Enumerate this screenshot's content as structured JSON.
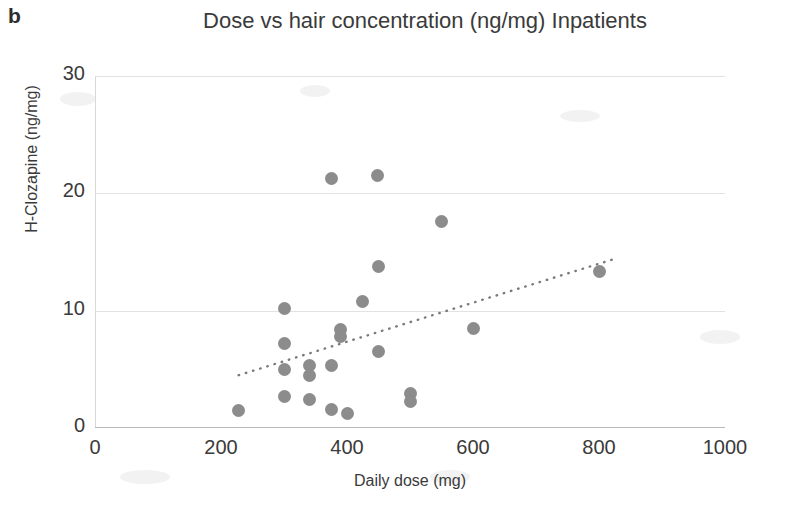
{
  "panel": {
    "label": "b"
  },
  "chart_data": {
    "type": "scatter",
    "title": "Dose vs hair concentration (ng/mg) Inpatients",
    "xlabel": "Daily dose (mg)",
    "ylabel": "H-Clozapine (ng/mg)",
    "xlim": [
      0,
      1000
    ],
    "ylim": [
      0,
      30
    ],
    "xticks": [
      0,
      200,
      400,
      600,
      800,
      1000
    ],
    "yticks": [
      0,
      10,
      20,
      30
    ],
    "xtick_labels": [
      "0",
      "200",
      "400",
      "600",
      "800",
      "1000"
    ],
    "ytick_labels": [
      "0",
      "10",
      "20",
      "30"
    ],
    "grid": "horizontal",
    "legend": "none",
    "marker_color": "#8c8c8c",
    "points": [
      {
        "x": 228,
        "y": 1.5
      },
      {
        "x": 300,
        "y": 10.2
      },
      {
        "x": 300,
        "y": 7.2
      },
      {
        "x": 300,
        "y": 5.0
      },
      {
        "x": 300,
        "y": 2.7
      },
      {
        "x": 340,
        "y": 5.3
      },
      {
        "x": 340,
        "y": 4.5
      },
      {
        "x": 340,
        "y": 2.4
      },
      {
        "x": 375,
        "y": 21.3
      },
      {
        "x": 375,
        "y": 5.3
      },
      {
        "x": 375,
        "y": 1.6
      },
      {
        "x": 390,
        "y": 8.4
      },
      {
        "x": 390,
        "y": 7.8
      },
      {
        "x": 400,
        "y": 1.2
      },
      {
        "x": 425,
        "y": 10.8
      },
      {
        "x": 448,
        "y": 21.5
      },
      {
        "x": 450,
        "y": 13.8
      },
      {
        "x": 450,
        "y": 6.5
      },
      {
        "x": 500,
        "y": 2.9
      },
      {
        "x": 500,
        "y": 2.3
      },
      {
        "x": 550,
        "y": 17.6
      },
      {
        "x": 600,
        "y": 8.5
      },
      {
        "x": 800,
        "y": 13.3
      }
    ],
    "trendline": {
      "style": "dotted",
      "color": "#7a7a7a",
      "x_start": 228,
      "y_start": 4.5,
      "x_end": 830,
      "y_end": 14.5
    }
  }
}
